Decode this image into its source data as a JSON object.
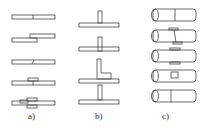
{
  "figure": {
    "groups": [
      {
        "id": "a",
        "label": "a)",
        "rows": [
          "butt joint",
          "lap joint",
          "scarf joint",
          "single strap joint",
          "double strap joint"
        ]
      },
      {
        "id": "b",
        "label": "b)",
        "rows": [
          "T-joint",
          "inserted T-joint",
          "angle T-joint",
          "filleted T-joint"
        ]
      },
      {
        "id": "c",
        "label": "c)",
        "rows": [
          "tube butt joint",
          "tube scarf-sleeve joint",
          "tube sleeve joint",
          "tube insert joint",
          "tube plain joint"
        ]
      }
    ],
    "colors": {
      "stroke": "#444444",
      "background": "#ffffff"
    }
  }
}
